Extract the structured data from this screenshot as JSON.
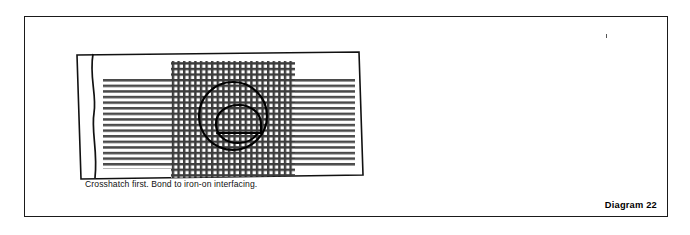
{
  "figure": {
    "kind": "instructional-sewing-diagram",
    "label": "Diagram 22",
    "border_color": "#1a1a1a",
    "background": "#ffffff",
    "ink_color": "#000000",
    "hatch_color": "#3a3a3a"
  },
  "panels": [
    {
      "id": "left",
      "caption": "Crosshatch first. Bond to iron-on interfacing.",
      "artwork": {
        "name": "fabric-strip-with-crosshatch",
        "motif_letter": "e",
        "motif_style": "outline",
        "regions": [
          {
            "name": "selvage-strip",
            "fill": "none",
            "edge": "wavy"
          },
          {
            "name": "horizontal-hatch-left",
            "pattern": "horizontal-lines"
          },
          {
            "name": "crosshatch-band",
            "pattern": "crosshatch"
          },
          {
            "name": "horizontal-hatch-right",
            "pattern": "horizontal-lines"
          }
        ]
      }
    },
    {
      "id": "right",
      "caption": "Then cut out your appliqué.",
      "artwork": {
        "name": "cut-out-applique-letter",
        "motif_letter": "e",
        "motif_style": "filled-crosshatch"
      }
    }
  ]
}
